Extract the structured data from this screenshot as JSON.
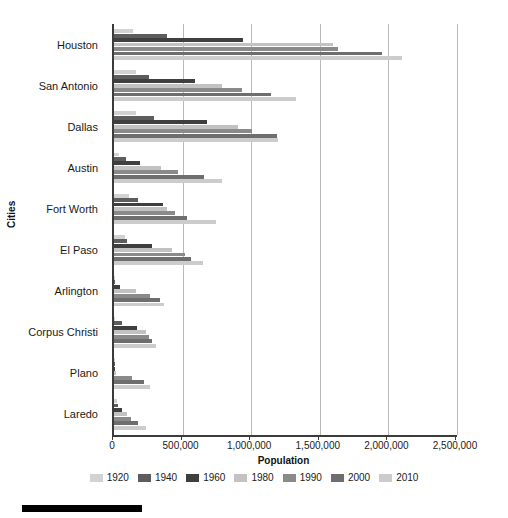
{
  "chart_data": {
    "type": "bar",
    "orientation": "horizontal",
    "title": "",
    "xlabel": "Population",
    "ylabel": "Cities",
    "xlim": [
      0,
      2500000
    ],
    "xticks": [
      0,
      500000,
      1000000,
      1500000,
      2000000,
      2500000
    ],
    "xtick_labels": [
      "0",
      "500,000",
      "1,000,000",
      "1,500,000",
      "2,000,000",
      "2,500,000"
    ],
    "grid": true,
    "legend_position": "bottom",
    "categories": [
      "Houston",
      "San Antonio",
      "Dallas",
      "Austin",
      "Fort Worth",
      "El Paso",
      "Arlington",
      "Corpus Christi",
      "Plano",
      "Laredo"
    ],
    "series": [
      {
        "name": "1920",
        "color": "#d2d2d2",
        "values": [
          138276,
          161379,
          158976,
          34876,
          106482,
          77560,
          3031,
          10522,
          1715,
          22710
        ]
      },
      {
        "name": "1940",
        "color": "#5d5d5d",
        "values": [
          384514,
          253854,
          294734,
          87930,
          177662,
          96810,
          4240,
          57301,
          1554,
          31780
        ]
      },
      {
        "name": "1960",
        "color": "#3f3f3f",
        "values": [
          938219,
          587718,
          679684,
          186545,
          356268,
          276687,
          44775,
          167690,
          3695,
          60678
        ]
      },
      {
        "name": "1980",
        "color": "#c2c2c2",
        "values": [
          1595138,
          785880,
          904078,
          345496,
          385164,
          425259,
          160113,
          231999,
          17872,
          91449
        ]
      },
      {
        "name": "1990",
        "color": "#8a8a8a",
        "values": [
          1630553,
          935933,
          1006877,
          465622,
          447619,
          515342,
          261721,
          257453,
          128713,
          122899
        ]
      },
      {
        "name": "2000",
        "color": "#6e6e6e",
        "values": [
          1953631,
          1144646,
          1188580,
          656562,
          534694,
          563662,
          332969,
          277454,
          222030,
          176576
        ]
      },
      {
        "name": "2010",
        "color": "#cccccc",
        "values": [
          2099451,
          1327407,
          1197816,
          790390,
          741206,
          649121,
          365438,
          305215,
          259841,
          236091
        ]
      }
    ]
  },
  "axes": {
    "y_title": "Cities",
    "x_title": "Population"
  },
  "legend": {
    "items": [
      {
        "label": "1920",
        "color": "#d2d2d2"
      },
      {
        "label": "1940",
        "color": "#5d5d5d"
      },
      {
        "label": "1960",
        "color": "#3f3f3f"
      },
      {
        "label": "1980",
        "color": "#c2c2c2"
      },
      {
        "label": "1990",
        "color": "#8a8a8a"
      },
      {
        "label": "2000",
        "color": "#6e6e6e"
      },
      {
        "label": "2010",
        "color": "#cccccc"
      }
    ]
  },
  "colors": {
    "axis": "#3b3b3b",
    "grid": "#b9b9b9",
    "text": "#1a1a1a",
    "rule": "#000000"
  }
}
